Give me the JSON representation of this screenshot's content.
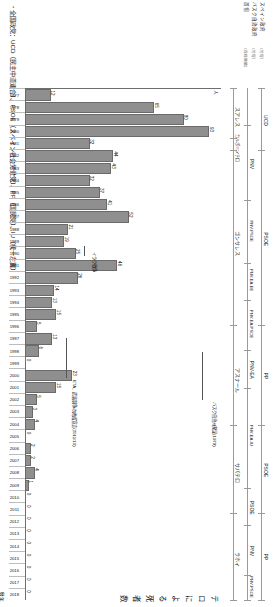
{
  "figure": {
    "title": "テロによる死者数",
    "y_unit": "人",
    "x_axis_title": "暦年",
    "caption": "・全国政党：UCD（民主中道連合）、PSOE（スペイン社会労働党）、PP（国民党）、IU（統一左翼）"
  },
  "row_labels": {
    "items": [
      {
        "label": "スペイン政府",
        "note": "（与党）"
      },
      {
        "label": "バスク自治政府",
        "note": "（与党）"
      },
      {
        "label": "首相",
        "note": "（在任期間）"
      }
    ]
  },
  "timeline": {
    "rows": [
      {
        "name": "spain-government",
        "segments": [
          {
            "label": "UCD",
            "start_year": 1977,
            "end_year": 1982
          },
          {
            "label": "PSOE",
            "start_year": 1982,
            "end_year": 1996
          },
          {
            "label": "PP",
            "start_year": 1996,
            "end_year": 2004
          },
          {
            "label": "PSOE",
            "start_year": 2004,
            "end_year": 2011
          },
          {
            "label": "PP",
            "start_year": 2011,
            "end_year": 2018
          }
        ]
      },
      {
        "name": "basque-government",
        "segments": [
          {
            "label": "PNV",
            "start_year": 1980,
            "end_year": 1986
          },
          {
            "label": "PNV-PSOE",
            "start_year": 1986,
            "end_year": 1991
          },
          {
            "label": "PNV-EA-EE",
            "start_year": 1991,
            "end_year": 1994
          },
          {
            "label": "PNV-EA-PSOE",
            "start_year": 1994,
            "end_year": 1998
          },
          {
            "label": "PNV-EA",
            "start_year": 1998,
            "end_year": 2001
          },
          {
            "label": "PNV-EA-IU",
            "start_year": 2001,
            "end_year": 2009
          },
          {
            "label": "PSOE",
            "start_year": 2009,
            "end_year": 2012
          },
          {
            "label": "PNV",
            "start_year": 2012,
            "end_year": 2016
          },
          {
            "label": "PNV-PSOE",
            "start_year": 2016,
            "end_year": 2018
          }
        ]
      },
      {
        "name": "prime-minister",
        "segments": [
          {
            "label": "スアレス",
            "start_year": 1977,
            "end_year": 1981
          },
          {
            "label": "カルボ＝ソテロ",
            "start_year": 1981,
            "end_year": 1982
          },
          {
            "label": "ゴンサレス",
            "start_year": 1982,
            "end_year": 1996
          },
          {
            "label": "アスナール",
            "start_year": 1996,
            "end_year": 2004
          },
          {
            "label": "サパテロ",
            "start_year": 2004,
            "end_year": 2011
          },
          {
            "label": "ラホイ",
            "start_year": 2011,
            "end_year": 2018
          }
        ]
      }
    ]
  },
  "annotations": [
    {
      "id": "basque-autonomy",
      "text": "バスク自治州発足(1979)"
    },
    {
      "id": "iraq-war",
      "text": "イラク戦争"
    },
    {
      "id": "eta-ceasefire",
      "text": "ETA、武装闘争の終結宣言(2011/10)"
    }
  ],
  "chart_data": {
    "type": "bar",
    "title": "テロによる死者数",
    "xlabel": "暦年",
    "ylabel": "人",
    "ylim": [
      0,
      100
    ],
    "grid": false,
    "legend": "none",
    "categories": [
      "1977",
      "1978",
      "1979",
      "1980",
      "1981",
      "1982",
      "1983",
      "1984",
      "1985",
      "1986",
      "1987",
      "1988",
      "1989",
      "1990",
      "1991",
      "1992",
      "1993",
      "1994",
      "1995",
      "1996",
      "1997",
      "1998",
      "1999",
      "2000",
      "2001",
      "2002",
      "2003",
      "2004",
      "2005",
      "2006",
      "2007",
      "2008",
      "2009",
      "2010",
      "2011",
      "2012",
      "2013",
      "2014",
      "2015",
      "2016",
      "2017",
      "2018"
    ],
    "values": [
      12,
      65,
      80,
      93,
      32,
      44,
      43,
      32,
      37,
      41,
      52,
      21,
      19,
      25,
      46,
      26,
      14,
      13,
      15,
      5,
      13,
      6,
      0,
      23,
      15,
      5,
      3,
      4,
      0,
      2,
      2,
      4,
      1,
      0,
      0,
      0,
      0,
      0,
      0,
      0,
      0,
      0
    ],
    "bar_value_labels": [
      "12",
      "65",
      "80",
      "93",
      "32",
      "44",
      "43",
      "32",
      "37",
      "41",
      "52",
      "21",
      "19",
      "25",
      "46",
      "26",
      "14",
      "13",
      "15",
      "5",
      "13",
      "6",
      "0",
      "23",
      "15",
      "5",
      "3",
      "4",
      "0",
      "2",
      "2",
      "4",
      "1",
      "0",
      "0",
      "0",
      "0",
      "0",
      "0",
      "0",
      "0",
      "0"
    ]
  },
  "colors": {
    "bar_fill": "#8f8f8f",
    "bar_stroke": "#6a6a6a",
    "axis": "#6e6e6e",
    "band": "#9a9a9a",
    "text": "#111111"
  }
}
